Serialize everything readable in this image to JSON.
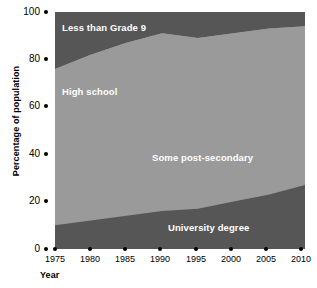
{
  "chart_data": {
    "type": "area",
    "title": "",
    "xlabel": "Year",
    "ylabel": "Percentage of population",
    "stacked": true,
    "normalized": true,
    "grid": false,
    "legend_position": "inline-labels",
    "xlim": [
      1975,
      2010
    ],
    "ylim": [
      0,
      100
    ],
    "x": [
      1975,
      1980,
      1985,
      1990,
      1995,
      2000,
      2005,
      2010
    ],
    "xticks": [
      "1975",
      "1980",
      "1985",
      "1990",
      "1995",
      "2000",
      "2005",
      "2010"
    ],
    "yticks": [
      "0",
      "20",
      "40",
      "60",
      "80",
      "100"
    ],
    "colors": {
      "dark": "#565656",
      "medium": "#9a9a9a",
      "label_text": "#ffffff",
      "axis_text": "#000000",
      "background": "#ffffff"
    },
    "series": [
      {
        "name": "University degree",
        "color": "#565656",
        "values": [
          10,
          12,
          14,
          16,
          17,
          20,
          23,
          27
        ],
        "label_position": "bottom"
      },
      {
        "name": "Some post-secondary",
        "color": "#9a9a9a",
        "values": [
          22,
          26,
          30,
          34,
          38,
          41,
          44,
          46
        ],
        "label_position": "lower-middle"
      },
      {
        "name": "High school",
        "color": "#9a9a9a",
        "values": [
          44,
          44,
          43,
          41,
          34,
          30,
          26,
          21
        ],
        "label_position": "upper-middle"
      },
      {
        "name": "Less than Grade 9",
        "color": "#565656",
        "values": [
          24,
          18,
          13,
          9,
          11,
          9,
          7,
          6
        ],
        "label_position": "top"
      }
    ],
    "boundaries": {
      "university_top": [
        10,
        12,
        14,
        16,
        17,
        20,
        23,
        27
      ],
      "post_secondary_top": [
        32,
        38,
        44,
        50,
        55,
        61,
        67,
        73
      ],
      "high_school_top": [
        76,
        82,
        87,
        91,
        89,
        91,
        93,
        94
      ]
    }
  },
  "axes": {
    "y_title": "Percentage of population",
    "x_title": "Year",
    "y_ticks": [
      {
        "label": "100",
        "value": 100
      },
      {
        "label": "80",
        "value": 80
      },
      {
        "label": "60",
        "value": 60
      },
      {
        "label": "40",
        "value": 40
      },
      {
        "label": "20",
        "value": 20
      },
      {
        "label": "0",
        "value": 0
      }
    ],
    "x_ticks": [
      {
        "label": "1975"
      },
      {
        "label": "1980"
      },
      {
        "label": "1985"
      },
      {
        "label": "1990"
      },
      {
        "label": "1995"
      },
      {
        "label": "2000"
      },
      {
        "label": "2005"
      },
      {
        "label": "2010"
      }
    ]
  },
  "series_labels": {
    "less_than_grade_9": "Less than Grade 9",
    "high_school": "High school",
    "some_post_secondary": "Some post-secondary",
    "university_degree": "University degree"
  }
}
